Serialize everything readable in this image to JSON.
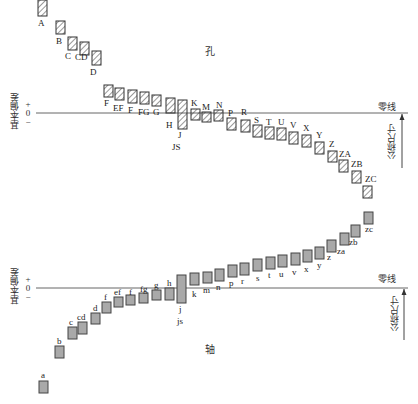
{
  "diagram": {
    "hole": {
      "title": "孔",
      "zero_line_label": "零线",
      "axis_label": "基本偏差",
      "nominal_size_label": "公称尺寸",
      "signs": [
        "+",
        "0",
        "−"
      ],
      "js_label": "JS",
      "deviations": [
        {
          "label": "A",
          "x": 38,
          "top": 0,
          "bottom": 16,
          "lx": 38,
          "ly": 19
        },
        {
          "label": "B",
          "x": 56,
          "top": 21,
          "bottom": 34,
          "lx": 56,
          "ly": 37
        },
        {
          "label": "C",
          "x": 68,
          "top": 37,
          "bottom": 50,
          "lx": 65,
          "ly": 52
        },
        {
          "label": "CD",
          "x": 80,
          "top": 42,
          "bottom": 55,
          "lx": 75,
          "ly": 53
        },
        {
          "label": "D",
          "x": 92,
          "top": 51,
          "bottom": 65,
          "lx": 90,
          "ly": 68
        },
        {
          "label": "F",
          "x": 104,
          "top": 85,
          "bottom": 97,
          "lx": 104,
          "ly": 99
        },
        {
          "label": "EF",
          "x": 115,
          "top": 88,
          "bottom": 100,
          "lx": 113,
          "ly": 104
        },
        {
          "label": "F",
          "x": 128,
          "top": 90,
          "bottom": 103,
          "lx": 128,
          "ly": 106
        },
        {
          "label": "FG",
          "x": 140,
          "top": 92,
          "bottom": 104,
          "lx": 138,
          "ly": 108
        },
        {
          "label": "G",
          "x": 152,
          "top": 95,
          "bottom": 106,
          "lx": 153,
          "ly": 108
        },
        {
          "label": "H",
          "x": 166,
          "top": 98,
          "bottom": 113,
          "lx": 166,
          "ly": 121
        },
        {
          "label": "J",
          "x": 178,
          "top": 100,
          "bottom": 129,
          "lx": 178,
          "ly": 131
        },
        {
          "label": "K",
          "x": 191,
          "top": 109,
          "bottom": 120,
          "lx": 191,
          "ly": 99
        },
        {
          "label": "M",
          "x": 202,
          "top": 112,
          "bottom": 122,
          "lx": 202,
          "ly": 103
        },
        {
          "label": "N",
          "x": 214,
          "top": 110,
          "bottom": 121,
          "lx": 216,
          "ly": 101
        },
        {
          "label": "P",
          "x": 227,
          "top": 118,
          "bottom": 130,
          "lx": 228,
          "ly": 109
        },
        {
          "label": "R",
          "x": 241,
          "top": 120,
          "bottom": 132,
          "lx": 241,
          "ly": 108
        },
        {
          "label": "S",
          "x": 253,
          "top": 125,
          "bottom": 137,
          "lx": 254,
          "ly": 116
        },
        {
          "label": "T",
          "x": 265,
          "top": 127,
          "bottom": 139,
          "lx": 266,
          "ly": 118
        },
        {
          "label": "U",
          "x": 277,
          "top": 128,
          "bottom": 140,
          "lx": 278,
          "ly": 118
        },
        {
          "label": "V",
          "x": 289,
          "top": 132,
          "bottom": 144,
          "lx": 290,
          "ly": 121
        },
        {
          "label": "X",
          "x": 302,
          "top": 135,
          "bottom": 147,
          "lx": 303,
          "ly": 124
        },
        {
          "label": "Y",
          "x": 315,
          "top": 142,
          "bottom": 154,
          "lx": 316,
          "ly": 131
        },
        {
          "label": "Z",
          "x": 328,
          "top": 151,
          "bottom": 162,
          "lx": 329,
          "ly": 140
        },
        {
          "label": "ZA",
          "x": 339,
          "top": 160,
          "bottom": 172,
          "lx": 339,
          "ly": 150
        },
        {
          "label": "ZB",
          "x": 352,
          "top": 171,
          "bottom": 183,
          "lx": 351,
          "ly": 160
        },
        {
          "label": "ZC",
          "x": 363,
          "top": 186,
          "bottom": 198,
          "lx": 365,
          "ly": 175
        }
      ]
    },
    "shaft": {
      "title": "轴",
      "zero_line_label": "零线",
      "axis_label": "基本偏差",
      "nominal_size_label": "公称尺寸",
      "signs": [
        "+",
        "0",
        "−"
      ],
      "js_label": "js",
      "deviations": [
        {
          "label": "a",
          "x": 39,
          "top": 381,
          "bottom": 393,
          "lx": 41,
          "ly": 371
        },
        {
          "label": "b",
          "x": 55,
          "top": 346,
          "bottom": 358,
          "lx": 57,
          "ly": 337
        },
        {
          "label": "c",
          "x": 68,
          "top": 327,
          "bottom": 339,
          "lx": 69,
          "ly": 318
        },
        {
          "label": "cd",
          "x": 78,
          "top": 322,
          "bottom": 334,
          "lx": 77,
          "ly": 313
        },
        {
          "label": "d",
          "x": 91,
          "top": 313,
          "bottom": 324,
          "lx": 93,
          "ly": 304
        },
        {
          "label": "f",
          "x": 102,
          "top": 302,
          "bottom": 313,
          "lx": 104,
          "ly": 293
        },
        {
          "label": "ef",
          "x": 114,
          "top": 297,
          "bottom": 307,
          "lx": 114,
          "ly": 288
        },
        {
          "label": "f",
          "x": 126,
          "top": 295,
          "bottom": 305,
          "lx": 129,
          "ly": 288
        },
        {
          "label": "fg",
          "x": 139,
          "top": 293,
          "bottom": 303,
          "lx": 140,
          "ly": 285
        },
        {
          "label": "g",
          "x": 152,
          "top": 290,
          "bottom": 300,
          "lx": 154,
          "ly": 281
        },
        {
          "label": "h",
          "x": 165,
          "top": 288,
          "bottom": 300,
          "lx": 167,
          "ly": 279
        },
        {
          "label": "j",
          "x": 177,
          "top": 275,
          "bottom": 303,
          "lx": 179,
          "ly": 305
        },
        {
          "label": "k",
          "x": 190,
          "top": 273,
          "bottom": 285,
          "lx": 192,
          "ly": 290
        },
        {
          "label": "m",
          "x": 203,
          "top": 272,
          "bottom": 283,
          "lx": 203,
          "ly": 286
        },
        {
          "label": "n",
          "x": 215,
          "top": 269,
          "bottom": 281,
          "lx": 216,
          "ly": 283
        },
        {
          "label": "p",
          "x": 228,
          "top": 265,
          "bottom": 277,
          "lx": 229,
          "ly": 279
        },
        {
          "label": "r",
          "x": 240,
          "top": 263,
          "bottom": 275,
          "lx": 241,
          "ly": 277
        },
        {
          "label": "s",
          "x": 253,
          "top": 259,
          "bottom": 271,
          "lx": 256,
          "ly": 274
        },
        {
          "label": "t",
          "x": 266,
          "top": 257,
          "bottom": 269,
          "lx": 268,
          "ly": 271
        },
        {
          "label": "u",
          "x": 278,
          "top": 255,
          "bottom": 267,
          "lx": 279,
          "ly": 270
        },
        {
          "label": "v",
          "x": 291,
          "top": 253,
          "bottom": 265,
          "lx": 292,
          "ly": 268
        },
        {
          "label": "x",
          "x": 303,
          "top": 250,
          "bottom": 262,
          "lx": 304,
          "ly": 265
        },
        {
          "label": "y",
          "x": 315,
          "top": 247,
          "bottom": 259,
          "lx": 317,
          "ly": 261
        },
        {
          "label": "z",
          "x": 327,
          "top": 240,
          "bottom": 252,
          "lx": 327,
          "ly": 253
        },
        {
          "label": "za",
          "x": 340,
          "top": 233,
          "bottom": 245,
          "lx": 337,
          "ly": 247
        },
        {
          "label": "zb",
          "x": 351,
          "top": 225,
          "bottom": 237,
          "lx": 349,
          "ly": 238
        },
        {
          "label": "zc",
          "x": 364,
          "top": 212,
          "bottom": 224,
          "lx": 365,
          "ly": 225
        }
      ]
    }
  }
}
